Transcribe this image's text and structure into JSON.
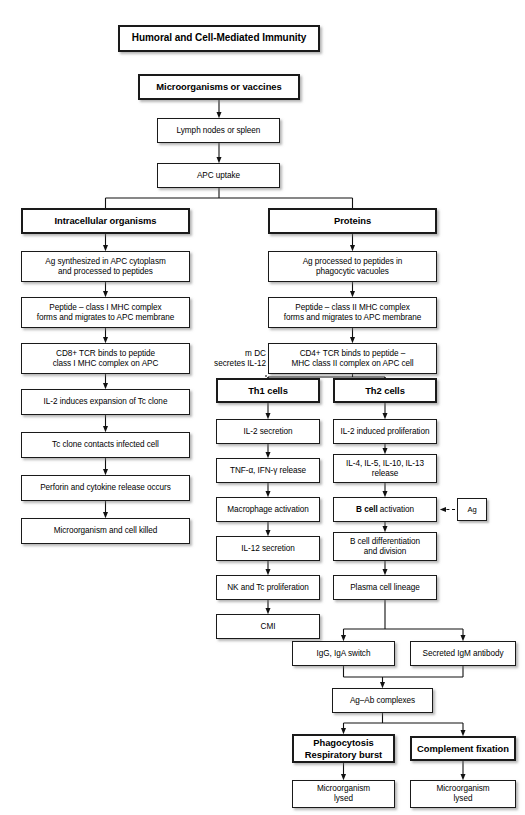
{
  "diagram": {
    "title": "Humoral and Cell-Mediated Immunity",
    "annotation_mdc": "m DC\nsecretes IL-12",
    "nodes": [
      {
        "id": "title",
        "label": "Humoral and Cell-Mediated Immunity",
        "style": "title",
        "x": 118,
        "y": 25,
        "w": 202,
        "h": 27
      },
      {
        "id": "micro",
        "label": "Microorganisms or vaccines",
        "style": "bold",
        "x": 138,
        "y": 74,
        "w": 162,
        "h": 26
      },
      {
        "id": "lymph",
        "label": "Lymph nodes or spleen",
        "style": "plain",
        "x": 157,
        "y": 118,
        "w": 123,
        "h": 25
      },
      {
        "id": "apc",
        "label": "APC  uptake",
        "style": "plain",
        "x": 157,
        "y": 163,
        "w": 123,
        "h": 25
      },
      {
        "id": "intra",
        "label": "Intracellular organisms",
        "style": "bold",
        "x": 21,
        "y": 208,
        "w": 169,
        "h": 26
      },
      {
        "id": "ag_syn",
        "label": "Ag synthesized in APC cytoplasm\nand processed to peptides",
        "style": "plain",
        "x": 21,
        "y": 251,
        "w": 169,
        "h": 31
      },
      {
        "id": "pep1",
        "label": "Peptide – class I MHC complex\nforms and migrates to APC membrane",
        "style": "plain",
        "x": 21,
        "y": 297,
        "w": 169,
        "h": 31
      },
      {
        "id": "cd8",
        "label": "CD8+ TCR binds to peptide\nclass I MHC complex on APC",
        "style": "plain",
        "x": 21,
        "y": 343,
        "w": 169,
        "h": 31
      },
      {
        "id": "il2_exp",
        "label": "IL-2 induces expansion of Tc clone",
        "style": "plain",
        "x": 21,
        "y": 389,
        "w": 169,
        "h": 26
      },
      {
        "id": "tc_contact",
        "label": "Tc clone contacts infected cell",
        "style": "plain",
        "x": 21,
        "y": 432,
        "w": 169,
        "h": 26
      },
      {
        "id": "perforin",
        "label": "Perforin and cytokine release occurs",
        "style": "plain",
        "x": 21,
        "y": 475,
        "w": 169,
        "h": 26
      },
      {
        "id": "micro_kill",
        "label": "Microorganism and cell killed",
        "style": "plain",
        "x": 21,
        "y": 518,
        "w": 169,
        "h": 26
      },
      {
        "id": "proteins",
        "label": "Proteins",
        "style": "bold",
        "x": 268,
        "y": 208,
        "w": 169,
        "h": 26
      },
      {
        "id": "ag_proc",
        "label": "Ag processed to peptides in\nphagocytic vacuoles",
        "style": "plain",
        "x": 268,
        "y": 251,
        "w": 169,
        "h": 31
      },
      {
        "id": "pep2",
        "label": "Peptide – class II MHC complex\nforms and migrates to APC membrane",
        "style": "plain",
        "x": 268,
        "y": 297,
        "w": 169,
        "h": 31
      },
      {
        "id": "cd4",
        "label": "CD4+ TCR binds to peptide –\nMHC class II complex on APC cell",
        "style": "plain",
        "x": 268,
        "y": 343,
        "w": 169,
        "h": 31
      },
      {
        "id": "th1",
        "label": "Th1 cells",
        "style": "bold",
        "x": 216,
        "y": 378,
        "w": 104,
        "h": 25
      },
      {
        "id": "th2",
        "label": "Th2 cells",
        "style": "bold",
        "x": 333,
        "y": 378,
        "w": 104,
        "h": 25
      },
      {
        "id": "il2_sec",
        "label": "IL-2 secretion",
        "style": "plain",
        "x": 216,
        "y": 419,
        "w": 104,
        "h": 25
      },
      {
        "id": "il2_prolif",
        "label": "IL-2 induced proliferation",
        "style": "plain",
        "x": 333,
        "y": 419,
        "w": 104,
        "h": 25
      },
      {
        "id": "tnf",
        "label": "TNF-α, IFN-γ release",
        "style": "plain",
        "x": 216,
        "y": 458,
        "w": 104,
        "h": 25
      },
      {
        "id": "il4",
        "label": "IL-4, IL-5, IL-10, IL-13\nrelease",
        "style": "plain",
        "x": 333,
        "y": 454,
        "w": 104,
        "h": 29
      },
      {
        "id": "macro",
        "label": "Macrophage activation",
        "style": "plain",
        "x": 216,
        "y": 497,
        "w": 104,
        "h": 25
      },
      {
        "id": "bcell_act",
        "label": "B cell activation",
        "style": "plain",
        "x": 333,
        "y": 497,
        "w": 104,
        "h": 25,
        "rich": "<b>B cell</b> activation"
      },
      {
        "id": "ag_box",
        "label": "Ag",
        "style": "small",
        "x": 457,
        "y": 498,
        "w": 30,
        "h": 23
      },
      {
        "id": "il12_sec",
        "label": "IL-12 secretion",
        "style": "plain",
        "x": 216,
        "y": 536,
        "w": 104,
        "h": 25
      },
      {
        "id": "bcell_diff",
        "label": "B cell differentiation\nand division",
        "style": "plain",
        "x": 333,
        "y": 532,
        "w": 104,
        "h": 29
      },
      {
        "id": "nk",
        "label": "NK and Tc proliferation",
        "style": "plain",
        "x": 216,
        "y": 575,
        "w": 104,
        "h": 25
      },
      {
        "id": "plasma",
        "label": "Plasma cell lineage",
        "style": "plain",
        "x": 333,
        "y": 575,
        "w": 104,
        "h": 25
      },
      {
        "id": "cmi",
        "label": "CMI",
        "style": "plain",
        "x": 216,
        "y": 614,
        "w": 104,
        "h": 25
      },
      {
        "id": "igg",
        "label": "IgG, IgA switch",
        "style": "plain",
        "x": 292,
        "y": 641,
        "w": 103,
        "h": 25
      },
      {
        "id": "igm",
        "label": "Secreted IgM antibody",
        "style": "plain",
        "x": 410,
        "y": 641,
        "w": 106,
        "h": 25
      },
      {
        "id": "agab",
        "label": "Ag–Ab complexes",
        "style": "plain",
        "x": 332,
        "y": 688,
        "w": 101,
        "h": 25
      },
      {
        "id": "phago",
        "label": "Phagocytosis\nRespiratory burst",
        "style": "bold",
        "x": 292,
        "y": 734,
        "w": 103,
        "h": 29
      },
      {
        "id": "complement",
        "label": "Complement fixation",
        "style": "bold",
        "x": 410,
        "y": 736,
        "w": 106,
        "h": 25
      },
      {
        "id": "lysed1",
        "label": "Microorganism\nlysed",
        "style": "plain",
        "x": 292,
        "y": 780,
        "w": 103,
        "h": 28
      },
      {
        "id": "lysed2",
        "label": "Microorganism\nlysed",
        "style": "plain",
        "x": 410,
        "y": 780,
        "w": 106,
        "h": 28
      }
    ],
    "edges": [
      {
        "from": "micro",
        "to": "lymph",
        "kind": "arrow-down"
      },
      {
        "from": "lymph",
        "to": "apc",
        "kind": "arrow-down"
      },
      {
        "from": "apc",
        "to": "intra,proteins",
        "kind": "split-plain"
      },
      {
        "from": "intra",
        "to": "ag_syn",
        "kind": "arrow-down"
      },
      {
        "from": "ag_syn",
        "to": "pep1",
        "kind": "arrow-down"
      },
      {
        "from": "pep1",
        "to": "cd8",
        "kind": "arrow-down"
      },
      {
        "from": "cd8",
        "to": "il2_exp",
        "kind": "arrow-down"
      },
      {
        "from": "il2_exp",
        "to": "tc_contact",
        "kind": "arrow-down"
      },
      {
        "from": "tc_contact",
        "to": "perforin",
        "kind": "arrow-down"
      },
      {
        "from": "perforin",
        "to": "micro_kill",
        "kind": "arrow-down"
      },
      {
        "from": "proteins",
        "to": "ag_proc",
        "kind": "arrow-down"
      },
      {
        "from": "ag_proc",
        "to": "pep2",
        "kind": "arrow-down"
      },
      {
        "from": "pep2",
        "to": "cd4",
        "kind": "arrow-down"
      },
      {
        "from": "cd4",
        "to": "th1,th2",
        "kind": "split-plain"
      },
      {
        "from": "th1",
        "to": "il2_sec",
        "kind": "arrow-down"
      },
      {
        "from": "il2_sec",
        "to": "tnf",
        "kind": "arrow-down"
      },
      {
        "from": "tnf",
        "to": "macro",
        "kind": "arrow-down"
      },
      {
        "from": "macro",
        "to": "il12_sec",
        "kind": "arrow-down"
      },
      {
        "from": "il12_sec",
        "to": "nk",
        "kind": "arrow-down"
      },
      {
        "from": "nk",
        "to": "cmi",
        "kind": "arrow-down"
      },
      {
        "from": "th2",
        "to": "il2_prolif",
        "kind": "arrow-down"
      },
      {
        "from": "il2_prolif",
        "to": "il4",
        "kind": "arrow-down"
      },
      {
        "from": "il4",
        "to": "bcell_act",
        "kind": "arrow-down"
      },
      {
        "from": "ag_box",
        "to": "bcell_act",
        "kind": "dashed-arrow-left"
      },
      {
        "from": "bcell_act",
        "to": "bcell_diff",
        "kind": "arrow-down"
      },
      {
        "from": "bcell_diff",
        "to": "plasma",
        "kind": "arrow-down"
      },
      {
        "from": "plasma",
        "to": "igg,igm",
        "kind": "split-arrow"
      },
      {
        "from": "igg,igm",
        "to": "agab",
        "kind": "merge-arrow"
      },
      {
        "from": "agab",
        "to": "phago,complement",
        "kind": "split-arrow"
      },
      {
        "from": "phago",
        "to": "lysed1",
        "kind": "arrow-down"
      },
      {
        "from": "complement",
        "to": "lysed2",
        "kind": "arrow-down"
      }
    ]
  }
}
